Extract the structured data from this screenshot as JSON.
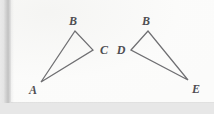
{
  "figure": {
    "background_color": "#e9e9e9",
    "page_color": "#fbfbfa",
    "line_color": "#6f6f72",
    "label_color": "#4e4e52",
    "shapes": [
      {
        "name": "triangle-abc",
        "vertices": [
          {
            "label": "A",
            "x": 41,
            "y": 82
          },
          {
            "label": "B",
            "x": 75,
            "y": 31
          },
          {
            "label": "C",
            "x": 93,
            "y": 50
          }
        ],
        "path": "M 41 82 L 75 31 L 93 50 Z"
      },
      {
        "name": "triangle-dbe",
        "vertices": [
          {
            "label": "D",
            "x": 131,
            "y": 50
          },
          {
            "label": "B",
            "x": 148,
            "y": 31
          },
          {
            "label": "E",
            "x": 188,
            "y": 80
          }
        ],
        "path": "M 131 50 L 148 31 L 188 80 Z"
      }
    ],
    "labels": [
      {
        "name": "label-a",
        "text": "A",
        "x": 33,
        "y": 90
      },
      {
        "name": "label-b-left",
        "text": "B",
        "x": 73,
        "y": 21
      },
      {
        "name": "label-c",
        "text": "C",
        "x": 104,
        "y": 50
      },
      {
        "name": "label-d",
        "text": "D",
        "x": 121,
        "y": 50
      },
      {
        "name": "label-b-right",
        "text": "B",
        "x": 146,
        "y": 21
      },
      {
        "name": "label-e",
        "text": "E",
        "x": 196,
        "y": 89
      }
    ]
  }
}
